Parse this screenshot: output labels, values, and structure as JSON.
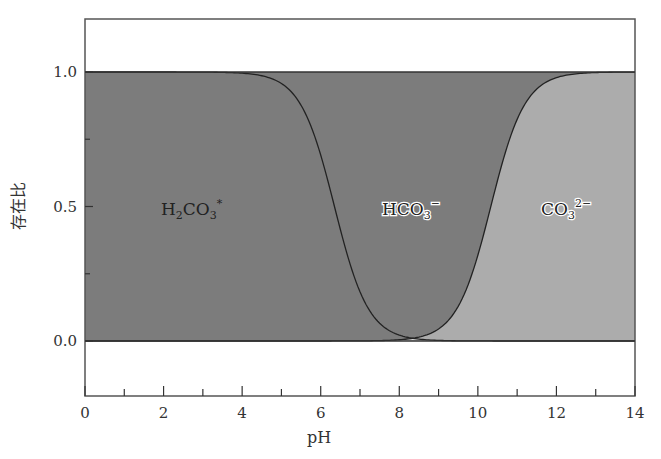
{
  "chart_data": {
    "type": "area",
    "title": "",
    "xlabel": "pH",
    "ylabel": "存在比",
    "xlim": [
      0,
      14
    ],
    "ylim": [
      -0.2,
      1.2
    ],
    "x_ticks_major": [
      0,
      2,
      4,
      6,
      8,
      10,
      12,
      14
    ],
    "x_ticks_minor": [
      1,
      3,
      5,
      7,
      9,
      11,
      13
    ],
    "y_ticks_major": [
      0.0,
      0.5,
      1.0
    ],
    "y_tick_labels": [
      "0.0",
      "0.5",
      "1.0"
    ],
    "y_ticks_minor": [
      0.25,
      0.75
    ],
    "grid": false,
    "stacked": true,
    "pKa1": 6.35,
    "pKa2": 10.33,
    "series": [
      {
        "name": "H2CO3*",
        "label_main": "H",
        "label_sub": "2",
        "label_main2": "CO",
        "label_sub2": "3",
        "label_sup": "*",
        "color": "#d4d4d4",
        "x": [
          0,
          4,
          5,
          5.5,
          6,
          6.35,
          6.7,
          7,
          7.5,
          8,
          9,
          14
        ],
        "values": [
          1.0,
          0.996,
          0.957,
          0.876,
          0.691,
          0.5,
          0.309,
          0.183,
          0.066,
          0.022,
          0.002,
          0.0
        ]
      },
      {
        "name": "HCO3-",
        "label_main": "HCO",
        "label_sub": "3",
        "label_sup": "−",
        "color": "#acacac",
        "x": [
          0,
          4,
          5,
          6,
          6.35,
          7,
          8,
          9,
          10,
          10.33,
          11,
          12,
          14
        ],
        "values": [
          0.0,
          0.004,
          0.043,
          0.309,
          0.5,
          0.816,
          0.973,
          0.955,
          0.681,
          0.5,
          0.176,
          0.021,
          0.0
        ]
      },
      {
        "name": "CO3 2-",
        "label_main": "CO",
        "label_sub": "3",
        "label_sup": "2−",
        "color": "#7c7c7c",
        "x": [
          0,
          8,
          9,
          10,
          10.33,
          11,
          12,
          13,
          14
        ],
        "values": [
          0.0,
          0.005,
          0.045,
          0.319,
          0.5,
          0.824,
          0.979,
          0.998,
          1.0
        ]
      }
    ]
  }
}
